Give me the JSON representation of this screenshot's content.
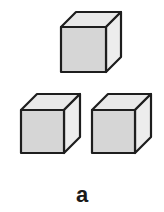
{
  "figure": {
    "label": "a",
    "colors": {
      "front": "#d6d6d6",
      "top": "#e9e9e9",
      "side": "#ededed",
      "stroke": "#1e1e1e",
      "background": "#ffffff"
    },
    "cubes": [
      {
        "id": "top-cube",
        "x": 61,
        "y": 27,
        "size": 45,
        "depth": 15
      },
      {
        "id": "bottom-left-cube",
        "x": 21,
        "y": 110,
        "size": 43,
        "depth": 16
      },
      {
        "id": "bottom-right-cube",
        "x": 92,
        "y": 110,
        "size": 43,
        "depth": 16
      }
    ]
  }
}
